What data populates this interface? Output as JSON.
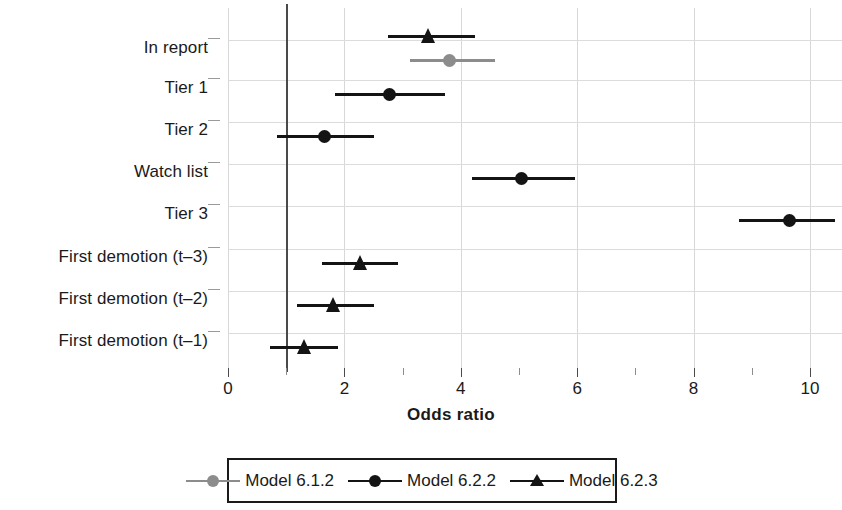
{
  "chart_data": {
    "type": "scatter",
    "subtype": "forest-plot",
    "title": "",
    "xlabel": "Odds ratio",
    "ylabel": "",
    "xlim": [
      0,
      10.55
    ],
    "xticks": [
      0,
      1,
      2,
      3,
      4,
      5,
      6,
      7,
      8,
      9,
      10
    ],
    "xticklabels": [
      "0",
      "",
      "2",
      "",
      "4",
      "",
      "6",
      "",
      "8",
      "",
      "10"
    ],
    "reference_line": 1,
    "grid": true,
    "legend_position": "bottom",
    "categories": [
      "In report",
      "Tier 1",
      "Tier 2",
      "Watch list",
      "Tier 3",
      "First demotion (t–3)",
      "First demotion (t–2)",
      "First demotion (t–1)"
    ],
    "series": [
      {
        "name": "Model 6.1.2",
        "marker": "circle",
        "color": "#8c8c8c",
        "points": [
          {
            "category": "In report",
            "estimate": 3.81,
            "ci_low": 3.13,
            "ci_high": 4.59
          }
        ]
      },
      {
        "name": "Model 6.2.2",
        "marker": "circle",
        "color": "#141414",
        "points": [
          {
            "category": "Tier 1",
            "estimate": 2.78,
            "ci_low": 1.84,
            "ci_high": 3.73
          },
          {
            "category": "Tier 2",
            "estimate": 1.65,
            "ci_low": 0.84,
            "ci_high": 2.51
          },
          {
            "category": "Watch list",
            "estimate": 5.05,
            "ci_low": 4.19,
            "ci_high": 5.96
          },
          {
            "category": "Tier 3",
            "estimate": 9.64,
            "ci_low": 8.78,
            "ci_high": 10.43
          }
        ]
      },
      {
        "name": "Model 6.2.3",
        "marker": "triangle",
        "color": "#141414",
        "points": [
          {
            "category": "In report",
            "estimate": 3.44,
            "ci_low": 2.75,
            "ci_high": 4.24
          },
          {
            "category": "First demotion (t–3)",
            "estimate": 2.27,
            "ci_low": 1.62,
            "ci_high": 2.92
          },
          {
            "category": "First demotion (t–2)",
            "estimate": 1.82,
            "ci_low": 1.19,
            "ci_high": 2.51
          },
          {
            "category": "First demotion (t–1)",
            "estimate": 1.32,
            "ci_low": 0.72,
            "ci_high": 1.89
          }
        ]
      }
    ]
  },
  "axis": {
    "x_title": "Odds ratio",
    "tick_labels": [
      "0",
      "2",
      "4",
      "6",
      "8",
      "10"
    ],
    "tick_values": [
      0,
      2,
      4,
      6,
      8,
      10
    ]
  },
  "y_categories": [
    {
      "label": "In report"
    },
    {
      "label": "Tier 1"
    },
    {
      "label": "Tier 2"
    },
    {
      "label": "Watch list"
    },
    {
      "label": "Tier 3"
    },
    {
      "label": "First demotion (t–3)"
    },
    {
      "label": "First demotion (t–2)"
    },
    {
      "label": "First demotion (t–1)"
    }
  ],
  "legend": {
    "items": [
      {
        "label": "Model 6.1.2",
        "marker": "circle-marker",
        "color": "#8c8c8c"
      },
      {
        "label": "Model 6.2.2",
        "marker": "circle-marker",
        "color": "#141414"
      },
      {
        "label": "Model 6.2.3",
        "marker": "triangle-marker",
        "color": "#141414"
      }
    ]
  },
  "colors": {
    "model_612": "#8c8c8c",
    "model_622": "#141414",
    "model_623": "#141414",
    "grid": "#dcdcdc",
    "reference_line": "#4a4a4a",
    "text": "#1a1a1a",
    "background": "#ffffff"
  }
}
